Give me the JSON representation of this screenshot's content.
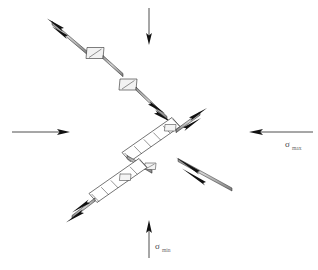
{
  "figure": {
    "background_color": "#ffffff",
    "line_color": "#1a1a1a",
    "fault_fill": "#c8c8c8",
    "label_color": "#4a4a4a",
    "width": 318,
    "height": 270
  },
  "stress_arrows": [
    {
      "name": "sigma-max-right",
      "symbol": "σ",
      "subscript": "max",
      "direction": "left",
      "description": "Horizontal arrow pointing left on the right side",
      "x1": 313,
      "y1": 132,
      "x2": 248,
      "y2": 132,
      "label_x": 288,
      "label_y": 147
    },
    {
      "name": "sigma-max-left",
      "symbol": "",
      "subscript": "",
      "direction": "right",
      "description": "Horizontal arrow pointing right on the left side",
      "x1": 12,
      "y1": 132,
      "x2": 70,
      "y2": 132,
      "label_x": 0,
      "label_y": 0
    },
    {
      "name": "sigma-min-bottom",
      "symbol": "σ",
      "subscript": "min",
      "direction": "up",
      "description": "Vertical arrow pointing up at bottom centre",
      "x1": 149,
      "y1": 258,
      "x2": 149,
      "y2": 222,
      "label_x": 156,
      "label_y": 250
    },
    {
      "name": "sigma-min-top",
      "symbol": "",
      "subscript": "",
      "direction": "down",
      "description": "Vertical arrow pointing down at top centre",
      "x1": 149,
      "y1": 8,
      "x2": 149,
      "y2": 43,
      "label_x": 0,
      "label_y": 0
    }
  ],
  "fault_strands": [
    {
      "name": "upper-fault-strand",
      "description": "Upper-left NW-SE trending fault strand with two extensional jogs",
      "start": [
        51,
        22
      ],
      "end": [
        166,
        119
      ]
    },
    {
      "name": "central-fault-strand",
      "description": "Central fault strand with dilational duplex ladder segments",
      "start": [
        201,
        112
      ],
      "end": [
        72,
        220
      ]
    }
  ],
  "jogs": [
    {
      "name": "jog-upper-1",
      "description": "Small pull-apart parallelogram on upper strand",
      "cx": 95,
      "cy": 54
    },
    {
      "name": "jog-upper-2",
      "description": "Second pull-apart parallelogram on upper strand",
      "cx": 128,
      "cy": 86
    },
    {
      "name": "jog-central-1",
      "description": "Dilational duplex with tension gashes, upper central",
      "cx": 172,
      "cy": 138
    },
    {
      "name": "jog-central-2",
      "description": "Dilational duplex with tension gashes, lower central",
      "cx": 124,
      "cy": 186
    }
  ],
  "slip_arrows": [
    {
      "name": "slip-arrow-upper-nw",
      "description": "Double arrowhead pointing NW at top of upper strand"
    },
    {
      "name": "slip-arrow-upper-se",
      "description": "Double arrowhead pointing SE at base of upper strand"
    },
    {
      "name": "slip-arrow-central-ne",
      "description": "Double arrowhead pointing NE at top of central strand"
    },
    {
      "name": "slip-arrow-central-sw",
      "description": "Double arrowhead pointing SW at base of central strand"
    },
    {
      "name": "slip-arrow-lens",
      "description": "Lens-shaped double arrow indicator right of centre"
    }
  ]
}
